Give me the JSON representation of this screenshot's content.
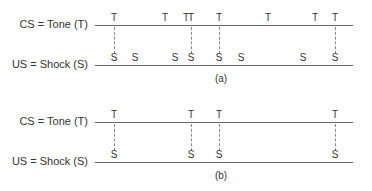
{
  "panels": [
    {
      "caption": "(a)",
      "cs_label": "CS = Tone (T)",
      "us_label": "US = Shock (S)",
      "tones": [
        114,
        165,
        186,
        191,
        219,
        268,
        315,
        335
      ],
      "shocks": [
        114,
        135,
        175,
        191,
        219,
        241,
        303,
        335
      ],
      "paired": [
        114,
        191,
        219,
        335
      ]
    },
    {
      "caption": "(b)",
      "cs_label": "CS = Tone (T)",
      "us_label": "US = Shock (S)",
      "tones": [
        114,
        191,
        219,
        335
      ],
      "shocks": [
        114,
        191,
        219,
        335
      ],
      "paired": [
        114,
        191,
        219,
        335
      ]
    }
  ],
  "symbols": {
    "tone": "T",
    "shock": "S"
  }
}
